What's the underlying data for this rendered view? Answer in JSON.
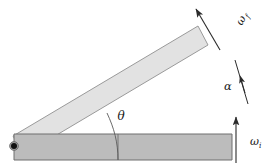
{
  "figure": {
    "background_color": "#ffffff",
    "width": 272,
    "height": 167
  },
  "labels": {
    "omega_final": {
      "symbol": "ω",
      "subscript": "f",
      "name": "final angular velocity",
      "x": 244,
      "y": 22
    },
    "omega_initial": {
      "symbol": "ω",
      "subscript": "i",
      "name": "initial angular velocity",
      "x": 250,
      "y": 145
    },
    "alpha": {
      "symbol": "α",
      "name": "angular acceleration",
      "x": 228,
      "y": 86
    },
    "theta": {
      "symbol": "θ",
      "name": "angular displacement",
      "x": 120,
      "y": 116
    }
  },
  "bodies": {
    "bar_initial": {
      "name": "horizontal-bar-initial-position",
      "fill": "#bcbcbc",
      "stroke": "#6e6e6e",
      "points": "14,134 232,134 232,160 14,160"
    },
    "bar_final": {
      "name": "tilted-bar-final-position",
      "fill": "#e2e2e2",
      "stroke": "#9a9a9a",
      "points": "13,136 198,26 208,45 23,155"
    }
  },
  "pivot": {
    "name": "pivot-point",
    "cx": 14,
    "cy": 146,
    "r_outer": 4.2,
    "r_inner": 3.0,
    "fill": "#111111"
  },
  "arcs": {
    "theta_arc": {
      "name": "theta-angle-arc",
      "path": "M 118 160 C 118 142 114 128 107 113",
      "stroke": "#5a5a5a"
    }
  },
  "arrows": {
    "omega_final_arrow": {
      "name": "omega-final-arrow",
      "x1": 220,
      "y1": 50,
      "x2": 196,
      "y2": 9,
      "stroke": "#2b2b2b"
    },
    "omega_initial_arrow": {
      "name": "omega-initial-arrow",
      "x1": 236,
      "y1": 163,
      "x2": 236,
      "y2": 117,
      "stroke": "#2b2b2b"
    },
    "alpha_arrow": {
      "name": "alpha-arrow",
      "x1": 247,
      "y1": 103,
      "x2": 236,
      "y2": 61,
      "head_x": 241,
      "head_y": 82,
      "stroke": "#2b2b2b"
    }
  },
  "tick": {
    "name": "vertical-reference-tick",
    "x": 118,
    "y1": 134,
    "y2": 160,
    "stroke": "#6e6e6e"
  }
}
